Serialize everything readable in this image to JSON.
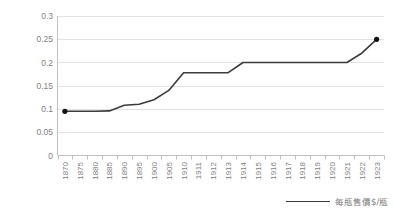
{
  "chart_data": {
    "type": "line",
    "title": "",
    "subtitle": "",
    "xlabel": "",
    "ylabel": "",
    "grid": true,
    "legend_position": "bottom-right",
    "ylim": [
      0,
      0.3
    ],
    "yticks": [
      "0",
      "0.05",
      "0.1",
      "0.15",
      "0.2",
      "0.25",
      "0.3"
    ],
    "ytick_values": [
      0,
      0.05,
      0.1,
      0.15,
      0.2,
      0.25,
      0.3
    ],
    "categories": [
      "1870",
      "1875",
      "1880",
      "1885",
      "1890",
      "1895",
      "1900",
      "1905",
      "1910",
      "1911",
      "1912",
      "1913",
      "1914",
      "1915",
      "1916",
      "1917",
      "1918",
      "1919",
      "1920",
      "1921",
      "1922",
      "1923"
    ],
    "series": [
      {
        "name": "每瓶售價$/瓶",
        "color": "#3b3b3b",
        "markers_at": [
          "1870",
          "1923"
        ],
        "values": [
          0.095,
          0.095,
          0.095,
          0.096,
          0.108,
          0.11,
          0.12,
          0.14,
          0.178,
          0.178,
          0.178,
          0.178,
          0.2,
          0.2,
          0.2,
          0.2,
          0.2,
          0.2,
          0.2,
          0.2,
          0.22,
          0.25
        ]
      }
    ]
  },
  "legend": {
    "label": "每瓶售價$/瓶"
  },
  "axis": {
    "y_labels": [
      "0.3",
      "0.25",
      "0.2",
      "0.15",
      "0.1",
      "0.05",
      "0"
    ],
    "x_labels": [
      "1870",
      "1875",
      "1880",
      "1885",
      "1890",
      "1895",
      "1900",
      "1905",
      "1910",
      "1911",
      "1912",
      "1913",
      "1914",
      "1915",
      "1916",
      "1917",
      "1918",
      "1919",
      "1920",
      "1921",
      "1922",
      "1923"
    ]
  },
  "colors": {
    "line": "#3b3b3b",
    "grid": "#e2e2e2",
    "axis": "#bfbfbf",
    "text": "#808080",
    "background": "#ffffff"
  }
}
